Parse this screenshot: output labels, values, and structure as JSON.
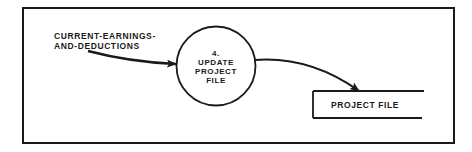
{
  "diagram": {
    "type": "data-flow-diagram",
    "colors": {
      "background": "#ffffff",
      "stroke": "#1a1a1a",
      "text": "#1a1a1a"
    },
    "input_flow": {
      "label_line1": "CURRENT-EARNINGS-",
      "label_line2": "AND-DEDUCTIONS"
    },
    "process": {
      "number": "4.",
      "line1": "UPDATE",
      "line2": "PROJECT",
      "line3": "FILE"
    },
    "data_store": {
      "label": "PROJECT FILE"
    }
  }
}
